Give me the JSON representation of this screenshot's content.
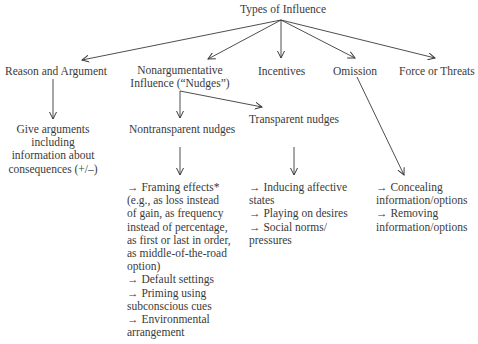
{
  "root": {
    "label": "Types of Influence"
  },
  "level1": [
    {
      "id": "reason",
      "label": "Reason and Argument"
    },
    {
      "id": "nudges",
      "label_lines": [
        "Nonargumentative",
        "Influence (“Nudges”)"
      ]
    },
    {
      "id": "incentives",
      "label": "Incentives"
    },
    {
      "id": "omission",
      "label": "Omission"
    },
    {
      "id": "force",
      "label": "Force or Threats"
    }
  ],
  "reason_detail": {
    "lines": [
      "Give arguments",
      "including",
      "information about",
      "consequences (+/–)"
    ]
  },
  "nudge_types": [
    {
      "id": "nontransparent",
      "label": "Nontransparent nudges"
    },
    {
      "id": "transparent",
      "label": "Transparent nudges"
    }
  ],
  "nontransparent_examples": {
    "lines": [
      {
        "arrow": true,
        "text": "Framing effects*"
      },
      {
        "arrow": false,
        "text": "(e.g., as loss instead"
      },
      {
        "arrow": false,
        "text": "of gain, as frequency"
      },
      {
        "arrow": false,
        "text": "instead of percentage,"
      },
      {
        "arrow": false,
        "text": "as first or last in order,"
      },
      {
        "arrow": false,
        "text": "as middle-of-the-road"
      },
      {
        "arrow": false,
        "text": "option)"
      },
      {
        "arrow": true,
        "text": "Default settings"
      },
      {
        "arrow": true,
        "text": "Priming using"
      },
      {
        "arrow": false,
        "text": "subconscious cues"
      },
      {
        "arrow": true,
        "text": "Environmental"
      },
      {
        "arrow": false,
        "text": "arrangement"
      }
    ]
  },
  "transparent_examples": {
    "lines": [
      {
        "arrow": true,
        "text": "Inducing affective"
      },
      {
        "arrow": false,
        "text": "states"
      },
      {
        "arrow": true,
        "text": "Playing on desires"
      },
      {
        "arrow": true,
        "text": "Social norms/"
      },
      {
        "arrow": false,
        "text": "pressures"
      }
    ]
  },
  "omission_examples": {
    "lines": [
      {
        "arrow": true,
        "text": "Concealing"
      },
      {
        "arrow": false,
        "text": "information/options"
      },
      {
        "arrow": true,
        "text": "Removing"
      },
      {
        "arrow": false,
        "text": "information/options"
      }
    ]
  },
  "colors": {
    "text": "#3a3a3a",
    "line": "#3a3a3a",
    "background": "#ffffff"
  }
}
